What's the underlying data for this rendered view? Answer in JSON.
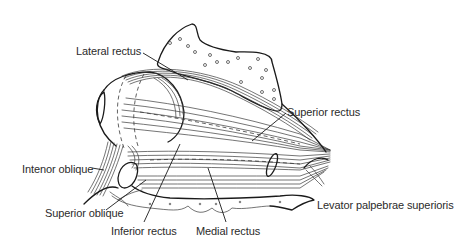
{
  "figure": {
    "labels": {
      "lateral_rectus": "Lateral rectus",
      "superior_rectus": "Superior rectus",
      "inferior_oblique": "Intenor oblique",
      "superior_oblique": "Superior oblique",
      "inferior_rectus": "Inferior rectus",
      "medial_rectus": "Medial rectus",
      "levator": "Levator palpebrae superioris"
    },
    "colors": {
      "line": "#1a1a1a",
      "text": "#2b2b2b",
      "background": "#ffffff"
    }
  }
}
